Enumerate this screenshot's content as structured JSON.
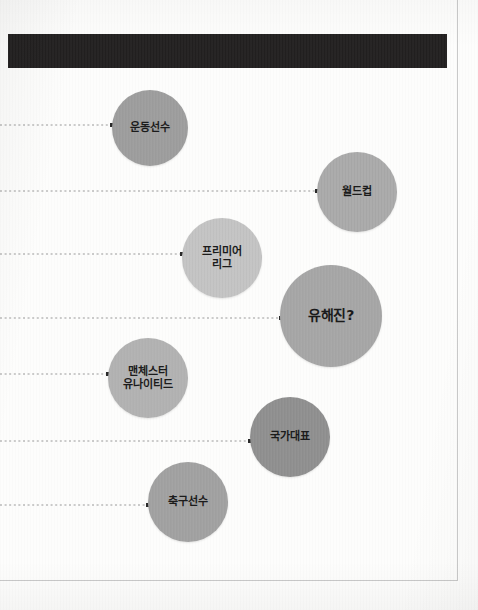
{
  "page": {
    "width": 478,
    "height": 610,
    "background_color": "#fdfdfc",
    "frame": {
      "right_rule_x": 457,
      "right_rule_height": 581,
      "bottom_rule_y": 580,
      "bottom_rule_width": 458,
      "rule_color": "#c9c9c9"
    }
  },
  "header_bar": {
    "name": "header-bar",
    "color": "#211f1f",
    "x": 8,
    "y": 34,
    "width": 439,
    "height": 34
  },
  "diagram": {
    "type": "bubble-association-map",
    "connector_color": "#9a9a9a",
    "connector_style": "dotted",
    "marker_color": "#2b2b2b",
    "bubbles": [
      {
        "id": "athlete",
        "label": "운동선수",
        "cx": 150,
        "cy": 128,
        "r": 38,
        "color": "#9b9b9b",
        "font_size": 11,
        "connector": {
          "x1": 0,
          "x2": 112,
          "y": 125
        }
      },
      {
        "id": "world-cup",
        "label": "월드컵",
        "cx": 357,
        "cy": 192,
        "r": 40,
        "color": "#a8a8a8",
        "font_size": 11,
        "connector": {
          "x1": 0,
          "x2": 317,
          "y": 191
        }
      },
      {
        "id": "premier-league",
        "label": "프리미어\n리그",
        "cx": 222,
        "cy": 258,
        "r": 40,
        "color": "#c2c2c2",
        "font_size": 11,
        "connector": {
          "x1": 0,
          "x2": 182,
          "y": 254
        }
      },
      {
        "id": "yoo-hae-jin",
        "label": "유해진?",
        "cx": 331,
        "cy": 316,
        "r": 51,
        "color": "#a4a4a4",
        "font_size": 14,
        "connector": {
          "x1": 0,
          "x2": 281,
          "y": 318
        }
      },
      {
        "id": "manchester-united",
        "label": "맨체스터\n유나이티드",
        "cx": 148,
        "cy": 378,
        "r": 40,
        "color": "#b0b0b0",
        "font_size": 11,
        "connector": {
          "x1": 0,
          "x2": 108,
          "y": 374
        }
      },
      {
        "id": "national-team",
        "label": "국가대표",
        "cx": 290,
        "cy": 437,
        "r": 40,
        "color": "#8d8d8d",
        "font_size": 11,
        "connector": {
          "x1": 0,
          "x2": 250,
          "y": 441
        }
      },
      {
        "id": "soccer-player",
        "label": "축구선수",
        "cx": 188,
        "cy": 502,
        "r": 40,
        "color": "#9f9f9f",
        "font_size": 11,
        "connector": {
          "x1": 0,
          "x2": 148,
          "y": 505
        }
      }
    ]
  }
}
